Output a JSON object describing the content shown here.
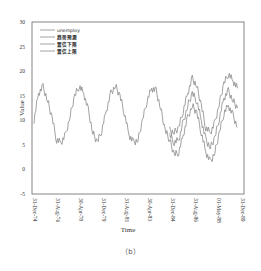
{
  "chart_data": {
    "type": "line",
    "title": "",
    "xlabel": "Time",
    "ylabel": "Value",
    "ylim": [
      -5,
      30
    ],
    "yticks": [
      -5,
      0,
      5,
      10,
      15,
      20,
      25,
      30
    ],
    "xticks": [
      "31-Dec-74",
      "31-Aug-76",
      "30-Apr-78",
      "31-Dec-79",
      "31-Aug-81",
      "30-Apr-83",
      "31-Dec-84",
      "31-Aug-86",
      "01-May-88",
      "31-Dec-89"
    ],
    "grid": false,
    "legend_position": "upper-left",
    "series": [
      {
        "name": "unemploy",
        "x": [
          0,
          0.2,
          0.4,
          0.6,
          0.8,
          1.0,
          1.2,
          1.4,
          1.6,
          1.8,
          2.0,
          2.2,
          2.4,
          2.6,
          2.8,
          3.0,
          3.2,
          3.4,
          3.6,
          3.8,
          4.0,
          4.2,
          4.4,
          4.6,
          4.8,
          5.0,
          5.2,
          5.4,
          5.6,
          5.8,
          6.0
        ],
        "values": [
          10,
          15.5,
          16.8,
          14,
          10.5,
          6,
          5.5,
          7,
          11,
          15,
          17,
          15.5,
          12,
          7.5,
          5.5,
          8,
          12,
          15.5,
          17,
          15,
          11.5,
          7,
          5.5,
          6,
          10,
          14,
          16.5,
          16,
          12.5,
          8,
          6
        ]
      },
      {
        "name": "趋势预测",
        "x": [
          6.0,
          6.2,
          6.4,
          6.6,
          6.8,
          7.0,
          7.2,
          7.4,
          7.6,
          7.8,
          8.0,
          8.2,
          8.4,
          8.6,
          8.8,
          9.0
        ],
        "values": [
          7,
          5.5,
          6,
          9.5,
          13,
          15.5,
          14,
          10,
          6,
          4.5,
          6.5,
          10.5,
          14.5,
          16,
          14,
          12.5
        ]
      },
      {
        "name": "置信下限",
        "x": [
          6.0,
          6.2,
          6.4,
          6.6,
          6.8,
          7.0,
          7.2,
          7.4,
          7.6,
          7.8,
          8.0,
          8.2,
          8.4,
          8.6,
          8.8,
          9.0
        ],
        "values": [
          6,
          3,
          3.5,
          7,
          10.5,
          13,
          11.5,
          7.5,
          3.5,
          1.5,
          3.5,
          7.5,
          11.5,
          13,
          11,
          8.5
        ]
      },
      {
        "name": "置信上限",
        "x": [
          6.0,
          6.2,
          6.4,
          6.6,
          6.8,
          7.0,
          7.2,
          7.4,
          7.6,
          7.8,
          8.0,
          8.2,
          8.4,
          8.6,
          8.8,
          9.0
        ],
        "values": [
          8,
          7.5,
          8.5,
          12,
          15.5,
          18.5,
          17,
          13,
          8.5,
          7.5,
          9.5,
          13.5,
          17.5,
          19.5,
          18,
          16.5
        ]
      }
    ],
    "caption": "（b）"
  },
  "legend": {
    "items": [
      "unemploy",
      "趋势预测",
      "置信下限",
      "置信上限"
    ]
  },
  "colors": {
    "line": "#8a8a8a",
    "axis": "#555555"
  }
}
